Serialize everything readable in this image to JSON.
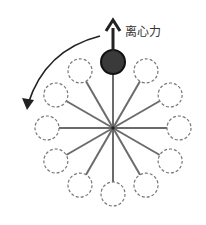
{
  "diagram": {
    "force_label": "离心力",
    "center": [
      113,
      128
    ],
    "spoke_radius": 66,
    "node_radius": 12,
    "node_count": 12,
    "highlighted_node_index": 0,
    "colors": {
      "spoke": "#6b6b6b",
      "node_dashed": "#777777",
      "node_solid_fill": "#3a3a3a",
      "node_solid_stroke": "#111111",
      "arrow": "#222222",
      "background": "#ffffff"
    },
    "rotation_direction": "counterclockwise"
  }
}
